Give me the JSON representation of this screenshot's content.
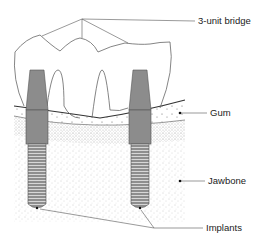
{
  "diagram": {
    "type": "dental-implant-bridge-cross-section",
    "labels": {
      "bridge": "3-unit bridge",
      "gum": "Gum",
      "jawbone": "Jawbone",
      "implants": "Implants"
    },
    "colors": {
      "implant_fill": "#8c8c8c",
      "outline": "#444444",
      "stipple": "#9a9a9a",
      "background": "#ffffff"
    }
  }
}
